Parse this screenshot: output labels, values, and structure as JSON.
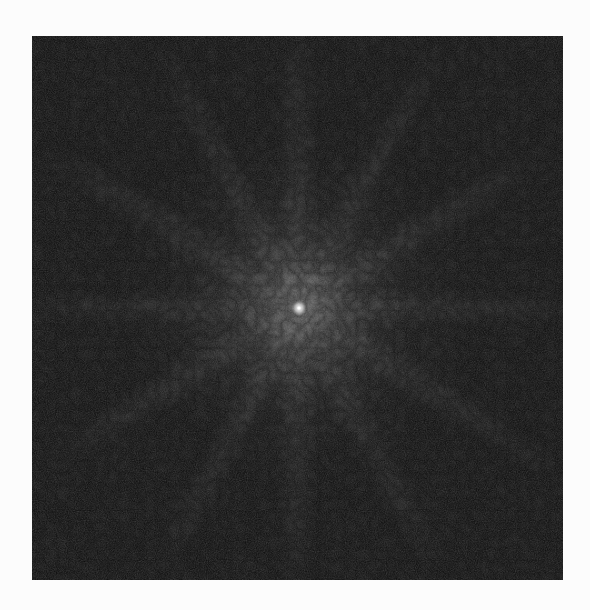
{
  "figure": {
    "type": "fourier-magnitude-spectrum",
    "background_color": "#fcfcfc",
    "panel": {
      "x": 32,
      "y": 36,
      "width": 531,
      "height": 544,
      "base_color": "#141414"
    },
    "center_point": {
      "x": 267,
      "y": 272,
      "color": "#f4f4f4"
    },
    "glow": {
      "inner_color": "#8a8a8a",
      "mid_color": "#4a4a4a",
      "outer_color": "#161616",
      "radius": 190
    },
    "rays": {
      "angles_deg": [
        0,
        30,
        60,
        90,
        120,
        150
      ],
      "color": "#5a5a5a"
    }
  }
}
